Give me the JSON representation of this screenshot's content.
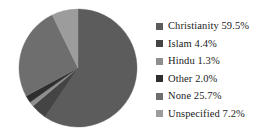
{
  "chart_data": {
    "type": "pie",
    "title": "",
    "subtitle": "",
    "xlabel": "",
    "ylabel": "",
    "grid": false,
    "legend_position": "right",
    "start_angle_deg": 0,
    "direction": "clockwise",
    "categories": [
      "Christianity",
      "Islam",
      "Hindu",
      "Other",
      "None",
      "Unspecified"
    ],
    "values": [
      59.5,
      4.4,
      1.3,
      2.0,
      25.7,
      7.2
    ],
    "value_unit": "%",
    "colors": [
      "#5c5c5c",
      "#444444",
      "#8f8f8f",
      "#2e2e2e",
      "#6e6e6e",
      "#9c9c9c"
    ],
    "slices": [
      {
        "label": "Christianity",
        "value": 59.5,
        "display": "Christianity 59.5%",
        "color": "#5c5c5c"
      },
      {
        "label": "Islam",
        "value": 4.4,
        "display": "Islam 4.4%",
        "color": "#444444"
      },
      {
        "label": "Hindu",
        "value": 1.3,
        "display": "Hindu 1.3%",
        "color": "#8f8f8f"
      },
      {
        "label": "Other",
        "value": 2.0,
        "display": "Other 2.0%",
        "color": "#2e2e2e"
      },
      {
        "label": "None",
        "value": 25.7,
        "display": "None 25.7%",
        "color": "#6e6e6e"
      },
      {
        "label": "Unspecified",
        "value": 7.2,
        "display": "Unspecified 7.2%",
        "color": "#9c9c9c"
      }
    ]
  },
  "legend": {
    "entries": [
      {
        "text": "Christianity 59.5%",
        "color": "#5c5c5c"
      },
      {
        "text": "Islam 4.4%",
        "color": "#444444"
      },
      {
        "text": "Hindu 1.3%",
        "color": "#8f8f8f"
      },
      {
        "text": "Other 2.0%",
        "color": "#2e2e2e"
      },
      {
        "text": "None 25.7%",
        "color": "#6e6e6e"
      },
      {
        "text": "Unspecified 7.2%",
        "color": "#9c9c9c"
      }
    ]
  },
  "figure": {
    "background": "#ffffff",
    "pie_center_x": 60,
    "pie_center_y": 60,
    "pie_radius": 59
  }
}
